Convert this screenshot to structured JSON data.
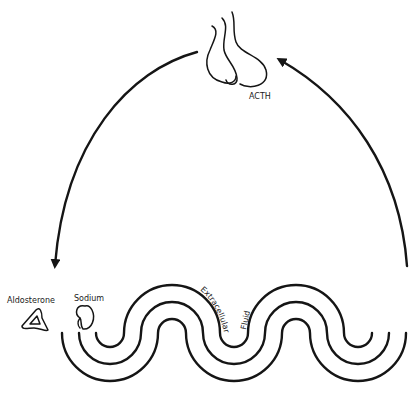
{
  "diagram": {
    "labels": {
      "gland": "ACTH",
      "hormone": "Aldosterone",
      "ion": "Sodium",
      "fluid_word1": "Extracellular",
      "fluid_word2": "Fluid"
    },
    "elements": [
      {
        "id": "pituitary-gland",
        "label": "ACTH",
        "icon": "gland-icon"
      },
      {
        "id": "adrenal-gland",
        "label": "Aldosterone",
        "icon": "adrenal-icon"
      },
      {
        "id": "kidney",
        "label": "Sodium",
        "icon": "kidney-icon"
      },
      {
        "id": "extracellular-fluid",
        "label": "Extracellular Fluid",
        "icon": "wave-bands"
      }
    ],
    "arrows": [
      {
        "from": "pituitary-gland",
        "to": "adrenal-gland",
        "direction": "down-left"
      },
      {
        "from": "extracellular-fluid",
        "to": "pituitary-gland",
        "direction": "up-left"
      }
    ],
    "colors": {
      "stroke": "#151515",
      "background": "#ffffff"
    }
  }
}
